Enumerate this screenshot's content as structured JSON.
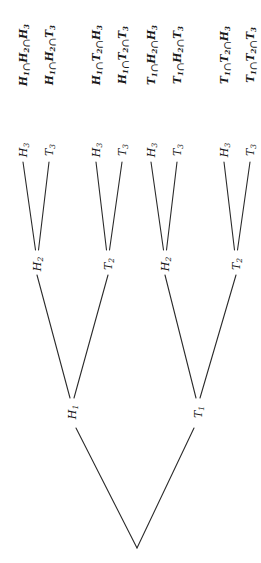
{
  "diagram": {
    "type": "probability-tree",
    "orientation": "rotated-90-ccw",
    "root": {
      "x": 137,
      "y": 548
    },
    "level1": [
      {
        "id": "H1",
        "letter": "H",
        "sub": "1",
        "x": 72,
        "y": 412
      },
      {
        "id": "T1",
        "letter": "T",
        "sub": "1",
        "x": 198,
        "y": 412
      }
    ],
    "level2": [
      {
        "id": "H1H2",
        "parent": "H1",
        "letter": "H",
        "sub": "2",
        "x": 37,
        "y": 264
      },
      {
        "id": "H1T2",
        "parent": "H1",
        "letter": "T",
        "sub": "2",
        "x": 108,
        "y": 264
      },
      {
        "id": "T1H2",
        "parent": "T1",
        "letter": "H",
        "sub": "2",
        "x": 165,
        "y": 264
      },
      {
        "id": "T1T2",
        "parent": "T1",
        "letter": "T",
        "sub": "2",
        "x": 236,
        "y": 264
      }
    ],
    "level3": [
      {
        "parent": "H1H2",
        "letter": "H",
        "sub": "3",
        "x": 23,
        "y": 150
      },
      {
        "parent": "H1H2",
        "letter": "T",
        "sub": "3",
        "x": 49,
        "y": 150
      },
      {
        "parent": "H1T2",
        "letter": "H",
        "sub": "3",
        "x": 96,
        "y": 150
      },
      {
        "parent": "H1T2",
        "letter": "T",
        "sub": "3",
        "x": 122,
        "y": 150
      },
      {
        "parent": "T1H2",
        "letter": "H",
        "sub": "3",
        "x": 151,
        "y": 150
      },
      {
        "parent": "T1H2",
        "letter": "T",
        "sub": "3",
        "x": 177,
        "y": 150
      },
      {
        "parent": "T1T2",
        "letter": "H",
        "sub": "3",
        "x": 224,
        "y": 150
      },
      {
        "parent": "T1T2",
        "letter": "T",
        "sub": "3",
        "x": 250,
        "y": 150
      }
    ],
    "outcomes": [
      {
        "text": "H1 ∩ H2 ∩ H3",
        "parts": [
          "H",
          "1",
          "H",
          "2",
          "H",
          "3"
        ],
        "x": 23,
        "y": 55
      },
      {
        "text": "H1 ∩ H2 ∩ T3",
        "parts": [
          "H",
          "1",
          "H",
          "2",
          "T",
          "3"
        ],
        "x": 49,
        "y": 55
      },
      {
        "text": "H1 ∩ T2 ∩ H3",
        "parts": [
          "H",
          "1",
          "T",
          "2",
          "H",
          "3"
        ],
        "x": 96,
        "y": 55
      },
      {
        "text": "H1 ∩ T2 ∩ T3",
        "parts": [
          "H",
          "1",
          "T",
          "2",
          "T",
          "3"
        ],
        "x": 122,
        "y": 55
      },
      {
        "text": "T1 ∩ H2 ∩ H3",
        "parts": [
          "T",
          "1",
          "H",
          "2",
          "H",
          "3"
        ],
        "x": 151,
        "y": 55
      },
      {
        "text": "T1 ∩ H2 ∩ T3",
        "parts": [
          "T",
          "1",
          "H",
          "2",
          "T",
          "3"
        ],
        "x": 177,
        "y": 55
      },
      {
        "text": "T1 ∩ T2 ∩ H3",
        "parts": [
          "T",
          "1",
          "T",
          "2",
          "H",
          "3"
        ],
        "x": 224,
        "y": 55
      },
      {
        "text": "T1 ∩ T2 ∩ T3",
        "parts": [
          "T",
          "1",
          "T",
          "2",
          "T",
          "3"
        ],
        "x": 250,
        "y": 55
      }
    ],
    "intersection_symbol": "∩",
    "line_color": "#2b2b2b",
    "text_color": "#1a1a1a",
    "background": "#ffffff"
  }
}
